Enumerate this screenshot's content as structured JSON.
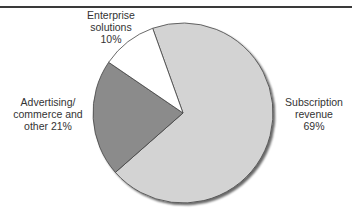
{
  "chart_data": {
    "type": "pie",
    "title": "",
    "categories": [
      "Subscription revenue",
      "Advertising/ commerce and other",
      "Enterprise solutions"
    ],
    "values": [
      69,
      21,
      10
    ],
    "unit": "%",
    "colors": [
      "#d3d3d3",
      "#8b8b8b",
      "#ffffff"
    ],
    "start_angle_deg": -109.7,
    "legend": "none (direct labels)",
    "labels": {
      "enterprise": [
        "Enterprise",
        "solutions",
        "10%"
      ],
      "advertising": [
        "Advertising/",
        "commerce and",
        "other 21%"
      ],
      "subscription": [
        "Subscription",
        "revenue",
        "69%"
      ]
    }
  }
}
